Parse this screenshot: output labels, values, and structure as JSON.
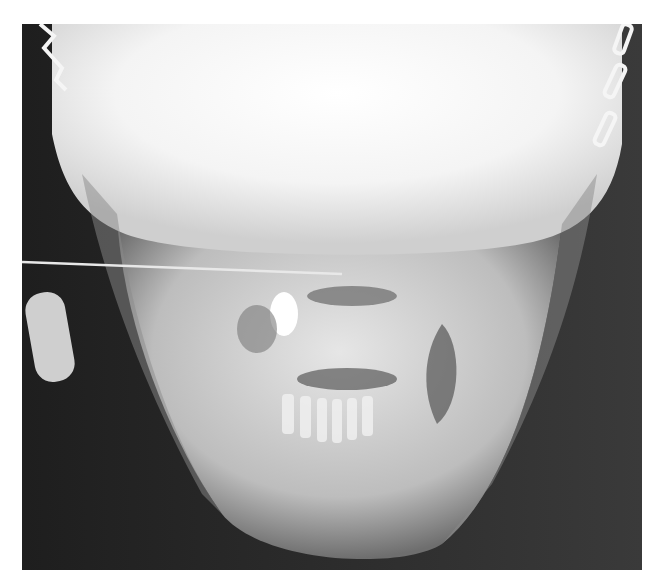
{
  "image": {
    "kind": "radiograph",
    "description": "Frontal (PA) X-ray of skull and mandible with head-frame clamps at upper corners, an oblong radiopaque object at left, and a horizontal wire line crossing the face",
    "colors": {
      "background_page": "#ffffff",
      "film_dark": "#2a2a2a",
      "bone_light": "#f2f2f2",
      "mid_gray": "#9a9a9a"
    }
  }
}
